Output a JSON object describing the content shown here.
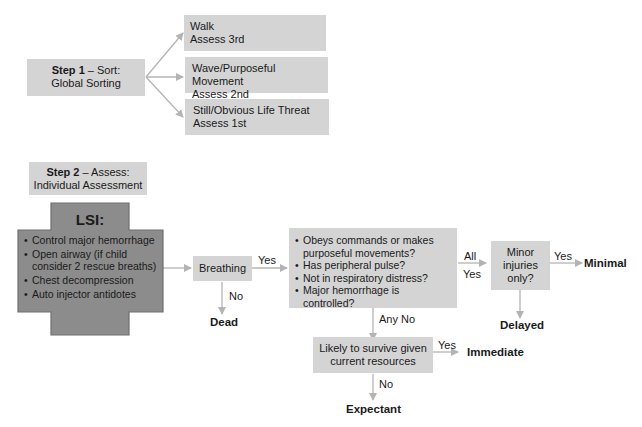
{
  "step1": {
    "title_bold": "Step 1",
    "title_rest": " – Sort:",
    "subtitle": "Global Sorting",
    "categories": [
      {
        "line1": "Walk",
        "line2": "Assess 3rd"
      },
      {
        "line1": "Wave/Purposeful Movement",
        "line2": "Assess 2nd"
      },
      {
        "line1": "Still/Obvious Life Threat",
        "line2": "Assess 1st"
      }
    ]
  },
  "step2": {
    "title_bold": "Step 2",
    "title_rest": " – Assess:",
    "subtitle": "Individual Assessment"
  },
  "lsi": {
    "title": "LSI:",
    "items": [
      "Control major hemorrhage",
      "Open airway (if child consider 2 rescue breaths)",
      "Chest decompression",
      "Auto injector antidotes"
    ]
  },
  "breathing": {
    "label": "Breathing",
    "yes_label": "Yes",
    "no_label": "No",
    "no_outcome": "Dead"
  },
  "assessment": {
    "questions": [
      "Obeys commands or makes purposeful movements?",
      "Has peripheral pulse?",
      "Not in respiratory distress?",
      "Major hemorrhage is controlled?"
    ],
    "all_yes_label_1": "All",
    "all_yes_label_2": "Yes",
    "any_no_label": "Any No"
  },
  "minor": {
    "line1": "Minor",
    "line2": "injuries",
    "line3": "only?",
    "yes_label": "Yes",
    "yes_outcome": "Minimal",
    "no_outcome": "Delayed"
  },
  "survive": {
    "line1": "Likely to survive given",
    "line2": "current resources",
    "yes_label": "Yes",
    "yes_outcome": "Immediate",
    "no_label": "No",
    "no_outcome": "Expectant"
  },
  "colors": {
    "box_fill": "#d4d4d4",
    "lsi_fill": "#8c8c8c",
    "lsi_border": "#6e6e6e",
    "arrow": "#b4b4b4"
  }
}
